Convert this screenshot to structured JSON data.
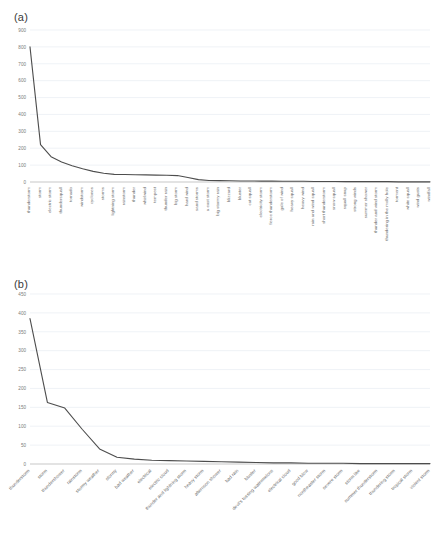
{
  "figure": {
    "panels": [
      {
        "key": "a",
        "label": "(a)"
      },
      {
        "key": "b",
        "label": "(b)"
      }
    ]
  },
  "chart_data": [
    {
      "panel": "(a)",
      "type": "line",
      "title": "",
      "xlabel": "",
      "ylabel": "",
      "ylim": [
        0,
        900
      ],
      "yticks": [
        0,
        100,
        200,
        300,
        400,
        500,
        600,
        700,
        800,
        900
      ],
      "grid": true,
      "legend": "none",
      "categories": [
        "thunderstorm",
        "storm",
        "electric storm",
        "thundersquall",
        "tornado",
        "windstorm",
        "cyclones",
        "storms",
        "lightning storm",
        "rainstorm",
        "thunder",
        "whirlwind",
        "tempest",
        "thunder rain",
        "big storm",
        "hard wind",
        "sand storms",
        "a east storm",
        "big stormy rain",
        "blizzard",
        "bluster",
        "cat squall",
        "electricity storm",
        "fierce thunderstorm",
        "gale of wind",
        "heavy squall",
        "heavy wind",
        "rain and wind squall",
        "short thunderstorm",
        "snow squall",
        "squall snap",
        "strong winds",
        "summer shower",
        "thunder and wind storm",
        "thundering in the molly hole",
        "torment",
        "white squall",
        "wind gusts",
        "windfall"
      ],
      "values": [
        800,
        221,
        150,
        118,
        96,
        78,
        63,
        52,
        45,
        44,
        43,
        42,
        41,
        40,
        38,
        27,
        14,
        9,
        8,
        7,
        6,
        6,
        5,
        5,
        4,
        4,
        4,
        3,
        3,
        3,
        2,
        2,
        2,
        2,
        2,
        1,
        1,
        1,
        1
      ]
    },
    {
      "panel": "(b)",
      "type": "line",
      "title": "",
      "xlabel": "",
      "ylabel": "",
      "ylim": [
        0,
        450
      ],
      "yticks": [
        0,
        50,
        100,
        150,
        200,
        250,
        300,
        350,
        400,
        450
      ],
      "grid": true,
      "legend": "none",
      "categories": [
        "thunderstorm",
        "storm",
        "thundershower",
        "rainstorm",
        "stormy weather",
        "stormy",
        "bad weather",
        "electrical",
        "electric cloud",
        "thunder and lightning storm",
        "heavy storm",
        "afternoon shower",
        "bad rain",
        "bluster",
        "devil's tossing watermelons",
        "electrical cloud",
        "good blow",
        "nordheaster storm",
        "severe storm",
        "storm like",
        "summer thunderstorm",
        "thundering storm",
        "tropical storm",
        "violent storm"
      ],
      "values": [
        385,
        163,
        148,
        92,
        40,
        18,
        13,
        10,
        9,
        8,
        7,
        6,
        5,
        4,
        3,
        3,
        2,
        2,
        2,
        1,
        1,
        1,
        1,
        1
      ]
    }
  ]
}
